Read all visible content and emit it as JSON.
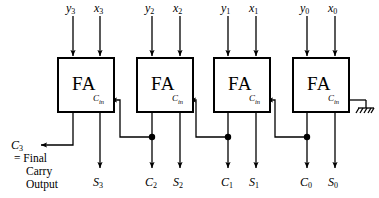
{
  "diagram": {
    "stroke_color": "#000000",
    "background_color": "#ffffff",
    "stages": [
      {
        "id": "fa3",
        "block_label": "FA",
        "cin_label": "Cin",
        "input_y": "y3",
        "input_x": "x3",
        "output_sum": "S3",
        "output_carry": "C3"
      },
      {
        "id": "fa2",
        "block_label": "FA",
        "cin_label": "Cin",
        "input_y": "y2",
        "input_x": "x2",
        "output_sum": "S2",
        "output_carry": "C2"
      },
      {
        "id": "fa1",
        "block_label": "FA",
        "cin_label": "Cin",
        "input_y": "y1",
        "input_x": "x1",
        "output_sum": "S1",
        "output_carry": "C1"
      },
      {
        "id": "fa0",
        "block_label": "FA",
        "cin_label": "Cin",
        "input_y": "y0",
        "input_x": "x0",
        "output_sum": "S0",
        "output_carry": "C0"
      }
    ],
    "final_carry": {
      "label": "C3",
      "note_line1": "= Final",
      "note_line2": "Carry",
      "note_line3": "Output"
    },
    "ground": {
      "name": "ground-symbol",
      "attached_to": "fa0-cin"
    }
  }
}
